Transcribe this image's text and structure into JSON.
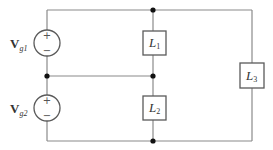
{
  "diagram": {
    "type": "circuit",
    "sources": [
      {
        "id": "vg1",
        "symbol": "V",
        "subscript": "g1",
        "plus": "+",
        "minus": "−"
      },
      {
        "id": "vg2",
        "symbol": "V",
        "subscript": "g2",
        "plus": "+",
        "minus": "−"
      }
    ],
    "loads": [
      {
        "id": "L1",
        "symbol": "L",
        "subscript": "1"
      },
      {
        "id": "L2",
        "symbol": "L",
        "subscript": "2"
      },
      {
        "id": "L3",
        "symbol": "L",
        "subscript": "3"
      }
    ],
    "colors": {
      "wire": "#8a8a8a",
      "component_outline": "#5a5a5a",
      "junction": "#111111",
      "text": "#333333",
      "background": "#ffffff"
    }
  }
}
